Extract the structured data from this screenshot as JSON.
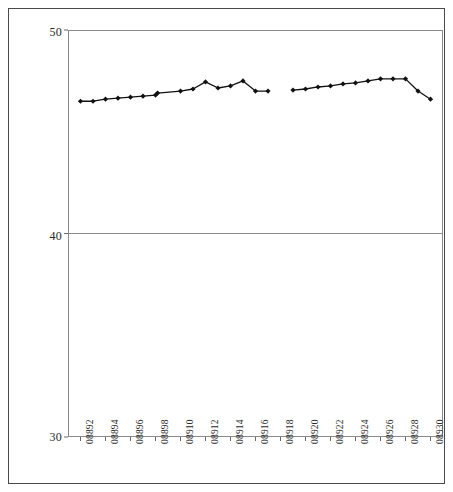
{
  "chart_data": {
    "type": "line",
    "title": "",
    "subtitle": "",
    "xlabel": "",
    "ylabel": "",
    "ylim": [
      30,
      50
    ],
    "yticks": [
      30,
      40,
      50
    ],
    "ytick_labels": [
      "30",
      "40",
      "50"
    ],
    "grid": true,
    "gridlines_y": [
      40
    ],
    "legend": "none",
    "marker": "diamond",
    "line_color": "#111111",
    "marker_color": "#111111",
    "axis_color": "#8a8a8a",
    "border_color": "#4a4a4a",
    "background": "#ffffff",
    "x_tick_labels": [
      "08892",
      "08894",
      "08896",
      "08898",
      "08910",
      "08912",
      "08914",
      "08916",
      "08918",
      "08920",
      "08922",
      "08924",
      "08926",
      "08928",
      "08930"
    ],
    "x_label_orientation": "vertical",
    "series": [
      {
        "name": "series-1",
        "segment": 1,
        "x": [
          "08892",
          "08893",
          "08894",
          "08895",
          "08896",
          "08897",
          "08898",
          "08899",
          "08910",
          "08911",
          "08912",
          "08913",
          "08914",
          "08915",
          "08916",
          "08917"
        ],
        "values": [
          46.5,
          46.5,
          46.6,
          46.65,
          46.7,
          46.75,
          46.8,
          46.9,
          47.0,
          47.1,
          47.45,
          47.15,
          47.25,
          47.5,
          47.0,
          47.0
        ]
      },
      {
        "name": "series-1",
        "segment": 2,
        "x": [
          "08919",
          "08920",
          "08921",
          "08922",
          "08923",
          "08924",
          "08925",
          "08926",
          "08927",
          "08928",
          "08929",
          "08930"
        ],
        "values": [
          47.05,
          47.1,
          47.2,
          47.25,
          47.35,
          47.4,
          47.5,
          47.6,
          47.6,
          47.6,
          47.0,
          46.6
        ]
      }
    ]
  }
}
